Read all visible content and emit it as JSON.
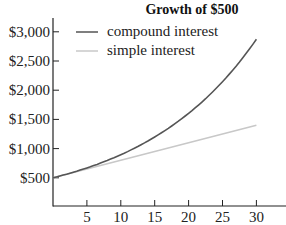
{
  "chart_data": {
    "type": "line",
    "title": "Growth of $500",
    "xlabel": "",
    "ylabel": "",
    "x": [
      0,
      5,
      10,
      15,
      20,
      25,
      30
    ],
    "series": [
      {
        "name": "compound interest",
        "color": "#555555",
        "values": [
          500,
          669,
          895,
          1198,
          1604,
          2146,
          2872
        ]
      },
      {
        "name": "simple interest",
        "color": "#c8c8c8",
        "values": [
          500,
          650,
          800,
          950,
          1100,
          1250,
          1400
        ]
      }
    ],
    "x_ticks": [
      5,
      10,
      15,
      20,
      25,
      30
    ],
    "x_tick_labels": [
      "5",
      "10",
      "15",
      "20",
      "25",
      "30"
    ],
    "y_ticks": [
      500,
      1000,
      1500,
      2000,
      2500,
      3000
    ],
    "y_tick_labels": [
      "$500",
      "$1,000",
      "$1,500",
      "$2,000",
      "$2,500",
      "$3,000"
    ],
    "xlim": [
      0,
      34
    ],
    "ylim": [
      0,
      3100
    ],
    "grid": false,
    "legend_position": "upper left"
  },
  "legend": {
    "items": [
      {
        "label": "compound interest",
        "color": "#555555"
      },
      {
        "label": "simple interest",
        "color": "#c8c8c8"
      }
    ]
  }
}
